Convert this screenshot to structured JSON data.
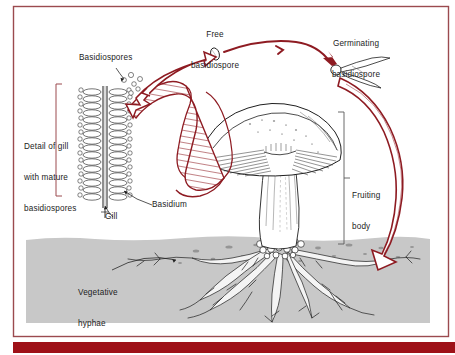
{
  "figure": {
    "background_color": "#ffffff",
    "frame_color": "#9b4a4f",
    "soil_color": "#c8c8c8",
    "ink_color": "#1c1c1c",
    "arrow_red": "#8e1b22",
    "accent_bar_color": "#9e1118"
  },
  "labels": {
    "free_basidiospore": {
      "line1": "Free",
      "line2": "basidiospore"
    },
    "germinating_basidiospore": {
      "line1": "Germinating",
      "line2": "basidiospore"
    },
    "basidiospores": "Basidiospores",
    "detail_of_gill": {
      "line1": "Detail of gill",
      "line2": "with mature",
      "line3": "basidiospores"
    },
    "basidium": "Basidium",
    "gill": "Gill",
    "fruiting_body": {
      "line1": "Fruiting",
      "line2": "body"
    },
    "vegetative_hyphae": {
      "line1": "Vegetative",
      "line2": "hyphae"
    }
  },
  "diagram_parts": [
    {
      "name": "gill-detail-drawing",
      "description": "Vertical gill section with rows of club-shaped basidia bearing basidiospores"
    },
    {
      "name": "mushroom-drawing",
      "description": "Fruiting body with hatched cap, gills and thick stipe"
    },
    {
      "name": "soil-band",
      "description": "Grey soil layer with speckles"
    },
    {
      "name": "hyphae-drawing",
      "description": "Branching vegetative hyphae network below soil surface"
    },
    {
      "name": "free-spore-drawing",
      "description": "Small oval free basidiospore"
    },
    {
      "name": "germinating-spore-drawing",
      "description": "Basidiospore with emerging germ tubes"
    }
  ],
  "cycle_arrows": [
    {
      "name": "arrow-gill-to-free-spore",
      "from": "Basidiospores on gill",
      "to": "Free basidiospore",
      "style": "open-outline"
    },
    {
      "name": "arrow-free-to-germinating",
      "from": "Free basidiospore",
      "to": "Germinating basidiospore",
      "style": "solid-thin"
    },
    {
      "name": "arrow-germinating-to-hyphae",
      "from": "Germinating basidiospore",
      "to": "Vegetative hyphae",
      "style": "open-outline-large"
    },
    {
      "name": "arrow-hyphae-to-gill",
      "from": "Fruiting body gill",
      "to": "Gill detail",
      "style": "hatched-ribbon"
    }
  ]
}
